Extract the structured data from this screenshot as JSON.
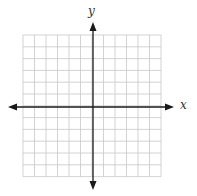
{
  "diagram": {
    "type": "coordinate-plane",
    "x_axis_label": "x",
    "y_axis_label": "y",
    "grid": {
      "columns": 12,
      "rows": 12,
      "left": 23,
      "top": 35,
      "cell_width": 11.5,
      "cell_height": 11.8,
      "line_color": "#c8c8c8"
    },
    "axes": {
      "color": "#1a1a1a",
      "origin_x": 93,
      "origin_y": 107,
      "x_start": 8,
      "x_end": 174,
      "y_start": 22,
      "y_end": 190
    },
    "colors": {
      "background": "#ffffff",
      "label": "#333333"
    }
  }
}
